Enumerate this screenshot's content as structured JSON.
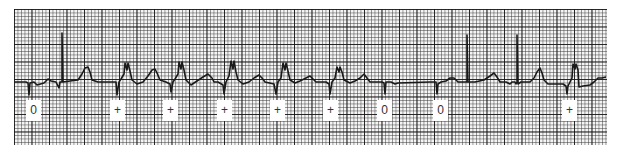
{
  "figure": {
    "type": "ecg-rhythm-strip",
    "trace_color": "#1a1a1a",
    "grid_color": "#222222"
  },
  "beat_labels": [
    {
      "text": "0",
      "x": 26
    },
    {
      "text": "+",
      "x": 110
    },
    {
      "text": "+",
      "x": 163
    },
    {
      "text": "+",
      "x": 217
    },
    {
      "text": "+",
      "x": 270
    },
    {
      "text": "+",
      "x": 323
    },
    {
      "text": "0",
      "x": 377
    },
    {
      "text": "0",
      "x": 433
    },
    {
      "text": "+",
      "x": 562
    }
  ]
}
